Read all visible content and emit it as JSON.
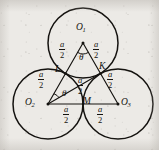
{
  "figure": {
    "type": "geometry-diagram",
    "background_color": "#eceae6",
    "ink_color": "#14120f",
    "circles": [
      {
        "name": "circle-O1",
        "center_label": "O",
        "center_sub": "1",
        "cx": 83,
        "cy": 43,
        "r": 35
      },
      {
        "name": "circle-O2",
        "center_label": "O",
        "center_sub": "2",
        "cx": 48,
        "cy": 104,
        "r": 35
      },
      {
        "name": "circle-O3",
        "center_label": "O",
        "center_sub": "3",
        "cx": 118,
        "cy": 104,
        "r": 35
      }
    ],
    "vertices": [
      {
        "id": "O1",
        "label": "O",
        "sub": "1",
        "x": 83,
        "y": 43
      },
      {
        "id": "O2",
        "label": "O",
        "sub": "2",
        "x": 48,
        "y": 104
      },
      {
        "id": "O3",
        "label": "O",
        "sub": "3",
        "x": 118,
        "y": 104
      }
    ],
    "tangency_points": [
      {
        "id": "L",
        "label": "L",
        "x": 65.5,
        "y": 73.5
      },
      {
        "id": "M",
        "label": "M",
        "x": 83,
        "y": 104
      },
      {
        "id": "K",
        "label": "K",
        "x": 100.5,
        "y": 73.5
      }
    ],
    "segments": [
      {
        "name": "segment-O1-L",
        "from": "O1",
        "to": "L",
        "length_label": "a/2"
      },
      {
        "name": "segment-O1-K",
        "from": "O1",
        "to": "K",
        "length_label": "a/2"
      },
      {
        "name": "segment-O2-L",
        "from": "O2",
        "to": "L",
        "length_label": "a/2"
      },
      {
        "name": "segment-O2-M",
        "from": "O2",
        "to": "M",
        "length_label": "a/2"
      },
      {
        "name": "segment-O2-K",
        "from": "O2",
        "to": "K",
        "length_label": "a/2"
      },
      {
        "name": "segment-O3-M",
        "from": "O3",
        "to": "M",
        "length_label": "a/2"
      },
      {
        "name": "segment-O3-K",
        "from": "O3",
        "to": "K",
        "length_label": "a/2"
      }
    ],
    "length_labels": [
      {
        "id": "len-O1-L",
        "numerator": "a",
        "denominator": "2",
        "x": 64,
        "y": 47
      },
      {
        "id": "len-O1-K",
        "numerator": "a",
        "denominator": "2",
        "x": 95,
        "y": 47
      },
      {
        "id": "len-O2-L",
        "numerator": "a",
        "denominator": "2",
        "x": 43,
        "y": 76
      },
      {
        "id": "len-O2-K",
        "numerator": "a",
        "denominator": "2",
        "x": 79,
        "y": 83
      },
      {
        "id": "len-K-O3",
        "numerator": "a",
        "denominator": "2",
        "x": 110,
        "y": 79
      },
      {
        "id": "len-O2-M",
        "numerator": "a",
        "denominator": "2",
        "x": 66,
        "y": 110
      },
      {
        "id": "len-M-O3",
        "numerator": "a",
        "denominator": "2",
        "x": 99,
        "y": 110
      }
    ],
    "angle_labels": [
      {
        "id": "angle-O1",
        "symbol": "θ",
        "x": 79,
        "y": 54,
        "at_vertex": "O1"
      },
      {
        "id": "angle-O2",
        "symbol": "θ",
        "x": 64,
        "y": 92,
        "at_vertex": "O2"
      }
    ],
    "point_labels": [
      {
        "id": "label-O1",
        "text": "O",
        "sub": "1",
        "x": 78,
        "y": 29
      },
      {
        "id": "label-O2",
        "text": "O",
        "sub": "2",
        "x": 28,
        "y": 100
      },
      {
        "id": "label-O3",
        "text": "O",
        "sub": "3",
        "x": 122,
        "y": 100
      },
      {
        "id": "label-L",
        "text": "L",
        "sub": "",
        "x": 57,
        "y": 67
      },
      {
        "id": "label-M",
        "text": "M",
        "sub": "",
        "x": 85,
        "y": 100
      },
      {
        "id": "label-K",
        "text": "K",
        "sub": "",
        "x": 100,
        "y": 64
      }
    ]
  }
}
